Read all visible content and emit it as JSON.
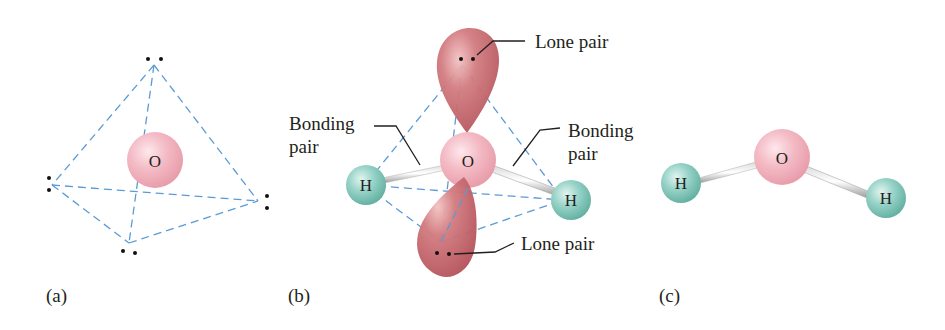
{
  "figure": {
    "colors": {
      "oxygen": "#f2b6c0",
      "hydrogen": "#8fcfc4",
      "lone_pair_lobe": "#c9626a",
      "dashed_edges": "#5b9bd5",
      "text": "#231f20"
    },
    "panels": [
      {
        "id": "a",
        "label": "(a)",
        "center_atom": "O",
        "description": "Tetrahedron with four electron pairs around O"
      },
      {
        "id": "b",
        "label": "(b)",
        "center_atom": "O",
        "hydrogens": [
          "H",
          "H"
        ],
        "callouts": {
          "lone_pair_top": "Lone pair",
          "lone_pair_bottom": "Lone pair",
          "bonding_left_line1": "Bonding",
          "bonding_left_line2": "pair",
          "bonding_right_line1": "Bonding",
          "bonding_right_line2": "pair"
        }
      },
      {
        "id": "c",
        "label": "(c)",
        "center_atom": "O",
        "hydrogens": [
          "H",
          "H"
        ],
        "description": "Bent H2O molecule"
      }
    ]
  }
}
